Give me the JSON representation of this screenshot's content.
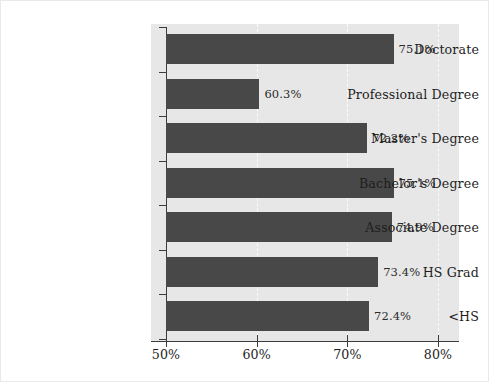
{
  "chart_data": {
    "type": "bar",
    "orientation": "horizontal",
    "title": "",
    "subtitle": "",
    "xlabel": "",
    "ylabel": "",
    "categories": [
      "Doctorate",
      "Professional Degree",
      "Master's Degree",
      "Bachelor's Degree",
      "Associate Degree",
      "HS Grad",
      "<HS"
    ],
    "values": [
      75.1,
      60.3,
      72.2,
      75.1,
      74.9,
      73.4,
      72.4
    ],
    "value_labels": [
      "75.1%",
      "60.3%",
      "72.2%",
      "75.1%",
      "74.9%",
      "73.4%",
      "72.4%"
    ],
    "xlim": [
      50,
      80
    ],
    "x_ticks": [
      50,
      60,
      70,
      80
    ],
    "x_tick_labels": [
      "50%",
      "60%",
      "70%",
      "80%"
    ],
    "grid": true,
    "grid_axis": "x",
    "grid_style": "dashed",
    "legend": false,
    "legend_position": "none",
    "colors": {
      "bar": "#484848",
      "plot_background": "#e7e7e7",
      "figure_background": "#ffffff",
      "axis": "#3c3c3c",
      "gridline": "#fbfbfb",
      "text": "#1d1d1d"
    }
  }
}
